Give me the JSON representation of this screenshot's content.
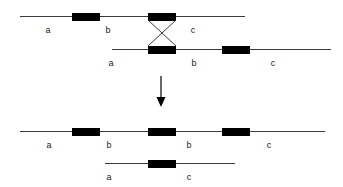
{
  "figure": {
    "colors": {
      "line": "#3a3a3a",
      "box": "#000000",
      "label": "#1a1a1a",
      "background": "#ffffff"
    },
    "arrow": {
      "name": "downward-arrow",
      "x": 161,
      "y_start": 76,
      "y_end": 106
    },
    "crossover": {
      "name": "crossover-x",
      "left_x": 148,
      "right_x": 176,
      "top_y": 20,
      "bottom_y": 46
    }
  },
  "chromosomes": [
    {
      "id": "parent-top",
      "name": "parent-chromosome-top",
      "line": {
        "x": 20,
        "y": 16,
        "width": 225
      },
      "boxes": [
        {
          "name": "marker-box-b-top",
          "x": 72,
          "width": 28
        },
        {
          "name": "marker-box-crossover-top",
          "x": 148,
          "width": 28
        }
      ],
      "labels": [
        {
          "text": "a",
          "x": 41,
          "y": 25
        },
        {
          "text": "b",
          "x": 101,
          "y": 25
        },
        {
          "text": "c",
          "x": 186,
          "y": 25
        }
      ]
    },
    {
      "id": "parent-bottom",
      "name": "parent-chromosome-bottom",
      "line": {
        "x": 112,
        "y": 49,
        "width": 219
      },
      "boxes": [
        {
          "name": "marker-box-crossover-bottom",
          "x": 148,
          "width": 28
        },
        {
          "name": "marker-box-b-bottom",
          "x": 222,
          "width": 28
        }
      ],
      "labels": [
        {
          "text": "a",
          "x": 104,
          "y": 58
        },
        {
          "text": "b",
          "x": 187,
          "y": 58
        },
        {
          "text": "c",
          "x": 266,
          "y": 58
        }
      ]
    },
    {
      "id": "recombinant-long",
      "name": "recombinant-chromosome-duplication",
      "line": {
        "x": 20,
        "y": 131,
        "width": 305
      },
      "boxes": [
        {
          "name": "marker-box-1",
          "x": 72,
          "width": 28
        },
        {
          "name": "marker-box-2",
          "x": 148,
          "width": 28
        },
        {
          "name": "marker-box-3",
          "x": 222,
          "width": 28
        }
      ],
      "labels": [
        {
          "text": "a",
          "x": 42,
          "y": 140
        },
        {
          "text": "b",
          "x": 102,
          "y": 140
        },
        {
          "text": "b",
          "x": 182,
          "y": 140
        },
        {
          "text": "c",
          "x": 262,
          "y": 140
        }
      ]
    },
    {
      "id": "recombinant-short",
      "name": "recombinant-chromosome-deletion",
      "line": {
        "x": 105,
        "y": 163,
        "width": 130
      },
      "boxes": [
        {
          "name": "marker-box-1",
          "x": 148,
          "width": 28
        }
      ],
      "labels": [
        {
          "text": "a",
          "x": 102,
          "y": 172
        },
        {
          "text": "c",
          "x": 182,
          "y": 172
        }
      ]
    }
  ]
}
